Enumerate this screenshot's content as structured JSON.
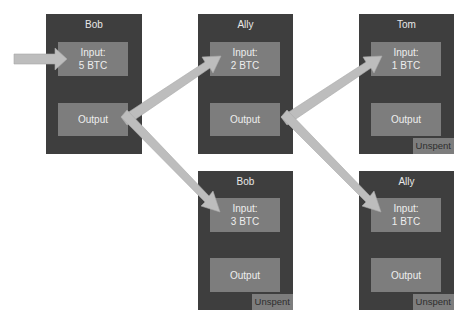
{
  "colors": {
    "box": "#3e3e3e",
    "slot": "#7d7d7d",
    "arrow": "#bdbdbd",
    "text_light": "#eeeeee",
    "text_dark": "#2e2e2e"
  },
  "transactions": [
    {
      "id": "bob-1",
      "owner": "Bob",
      "input_label": "Input:",
      "input_amount": "5 BTC",
      "output_label": "Output",
      "badge": null
    },
    {
      "id": "ally-1",
      "owner": "Ally",
      "input_label": "Input:",
      "input_amount": "2 BTC",
      "output_label": "Output",
      "badge": null
    },
    {
      "id": "tom-1",
      "owner": "Tom",
      "input_label": "Input:",
      "input_amount": "1 BTC",
      "output_label": "Output",
      "badge": "Unspent"
    },
    {
      "id": "bob-2",
      "owner": "Bob",
      "input_label": "Input:",
      "input_amount": "3 BTC",
      "output_label": "Output",
      "badge": "Unspent"
    },
    {
      "id": "ally-2",
      "owner": "Ally",
      "input_label": "Input:",
      "input_amount": "1 BTC",
      "output_label": "Output",
      "badge": "Unspent"
    }
  ],
  "flows": [
    {
      "from": "external",
      "to": "bob-1"
    },
    {
      "from": "bob-1",
      "to": "ally-1",
      "amount": "2 BTC"
    },
    {
      "from": "bob-1",
      "to": "bob-2",
      "amount": "3 BTC"
    },
    {
      "from": "ally-1",
      "to": "tom-1",
      "amount": "1 BTC"
    },
    {
      "from": "ally-1",
      "to": "ally-2",
      "amount": "1 BTC"
    }
  ]
}
